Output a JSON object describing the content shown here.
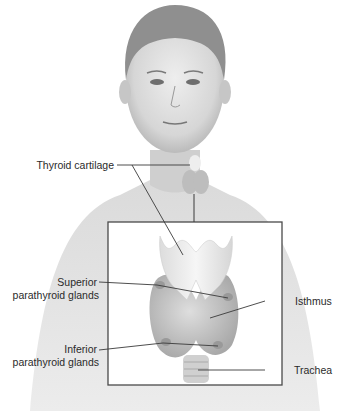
{
  "figure": {
    "labels": {
      "thyroid_cartilage": "Thyroid cartilage",
      "superior_line1": "Superior",
      "superior_line2": "parathyroid glands",
      "isthmus": "Isthmus",
      "inferior_line1": "Inferior",
      "inferior_line2": "parathyroid glands",
      "trachea": "Trachea"
    },
    "colors": {
      "background": "#ffffff",
      "skin": "#d9d9d9",
      "skin_shadow": "#b8b8b8",
      "hair": "#8a8a8a",
      "gland": "#c4c4c4",
      "cartilage": "#ececec",
      "leader_line": "#3a3a3a",
      "box_border": "#4a4a4a"
    }
  }
}
